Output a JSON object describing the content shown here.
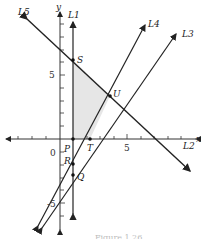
{
  "figure": {
    "axes": {
      "x_label": "x",
      "y_label": "y",
      "origin_label": "0",
      "x_tick_label": "5",
      "y_tick_label": "5",
      "y_neg_tick_label": "-5"
    },
    "lines": [
      {
        "id": "L1",
        "label": "L1"
      },
      {
        "id": "L2",
        "label": "L2"
      },
      {
        "id": "L3",
        "label": "L3"
      },
      {
        "id": "L4",
        "label": "L4"
      },
      {
        "id": "L5",
        "label": "L5"
      }
    ],
    "points": [
      {
        "id": "S",
        "label": "S"
      },
      {
        "id": "U",
        "label": "U"
      },
      {
        "id": "P",
        "label": "P"
      },
      {
        "id": "T",
        "label": "T"
      },
      {
        "id": "R",
        "label": "R"
      },
      {
        "id": "Q",
        "label": "Q"
      }
    ],
    "shaded_region": "PSUT",
    "caption": "Figure 1.26"
  }
}
